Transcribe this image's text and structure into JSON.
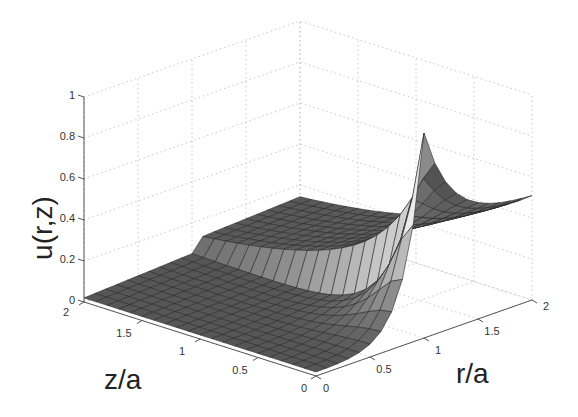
{
  "chart_data": {
    "type": "surface3d",
    "title": "",
    "xlabel": "r/a",
    "ylabel": "z/a",
    "zlabel": "u(r,z)",
    "x_ticks": [
      "0",
      "0.5",
      "1",
      "1.5",
      "2"
    ],
    "y_ticks": [
      "0",
      "0.5",
      "1",
      "1.5",
      "2"
    ],
    "z_ticks": [
      "0",
      "0.2",
      "0.4",
      "0.6",
      "0.8",
      "1"
    ],
    "xlim": [
      0,
      2
    ],
    "ylim": [
      0,
      2
    ],
    "zlim": [
      0,
      1
    ],
    "grid": true,
    "grid_style": "dotted",
    "colormap": "gray",
    "mesh_resolution": [
      21,
      21
    ],
    "sample_points": [
      {
        "r": 0,
        "z": 0,
        "u": 0.0
      },
      {
        "r": 0.5,
        "z": 0,
        "u": 0.12
      },
      {
        "r": 1.0,
        "z": 0,
        "u": 1.0
      },
      {
        "r": 1.5,
        "z": 0,
        "u": 0.62
      },
      {
        "r": 2.0,
        "z": 0,
        "u": 0.5
      },
      {
        "r": 0,
        "z": 2,
        "u": 0.0
      },
      {
        "r": 2.0,
        "z": 2,
        "u": 0.13
      },
      {
        "r": 1.0,
        "z": 1,
        "u": 0.08
      }
    ]
  }
}
